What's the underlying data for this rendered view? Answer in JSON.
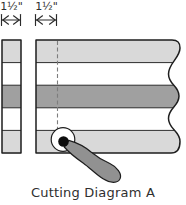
{
  "diagram": {
    "measurement_left": "1½\"",
    "measurement_right": "1½\"",
    "caption": "Cutting Diagram A",
    "band_colors": {
      "light": "#d9d9d9",
      "white": "#ffffff",
      "dark": "#a0a0a0"
    },
    "left_strip_bands": [
      "light",
      "white",
      "dark",
      "white",
      "light"
    ],
    "fabric_piece_bands": [
      "light",
      "white",
      "dark",
      "white",
      "light"
    ],
    "colors": {
      "outline": "#1e1e1e",
      "cut_line": "#7d7d7d",
      "cutter_handle": "#919191",
      "blade_center": "#0d0d0d",
      "text": "#2f2f2f"
    }
  }
}
